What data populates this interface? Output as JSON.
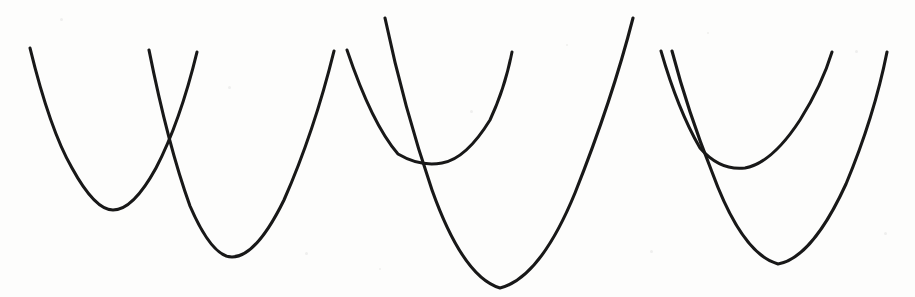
{
  "figure": {
    "width": 915,
    "height": 297,
    "background_color": "#fdfdfc",
    "stroke_color": "#181818",
    "stroke_width": 3.1,
    "caption": "",
    "panel_count": 3
  },
  "chart_data": {
    "type": "line",
    "subtitle": "",
    "xlabel": "",
    "ylabel": "",
    "xlim": [
      0,
      915
    ],
    "ylim": [
      297,
      0
    ],
    "grid": false,
    "legend": "none",
    "axes_visible": false,
    "tick_labels": [],
    "annotations": [],
    "coordinate_note": "Pixel coordinates; y increases downward as in image space.",
    "panels": [
      {
        "name": "panel-left",
        "relationship": "two distinct intersection points",
        "intersections": [
          [
            170,
            131
          ]
        ],
        "series": [
          {
            "name": "left-panel-curve-a",
            "role": "shallow-left-parabola",
            "vertex": [
              113,
              210
            ],
            "start": [
              30,
              48
            ],
            "end": [
              197,
              52
            ],
            "path": "M 30 48 Q 50 130 72 168 Q 95 210 113 210 Q 133 210 156 168 Q 180 122 197 52"
          },
          {
            "name": "left-panel-curve-b",
            "role": "deep-right-parabola",
            "vertex": [
              232,
              257
            ],
            "start": [
              149,
              50
            ],
            "end": [
              334,
              51
            ],
            "path": "M 149 50 Q 168 145 190 206 Q 212 257 232 257 Q 256 257 284 200 Q 314 132 334 51"
          }
        ]
      },
      {
        "name": "panel-middle",
        "relationship": "curves touch near the shallow vertex then diverge",
        "intersections": [
          [
            423,
            162
          ]
        ],
        "series": [
          {
            "name": "middle-panel-curve-a",
            "role": "shallow-parabola",
            "vertex": [
              442,
              163
            ],
            "start": [
              347,
              50
            ],
            "end": [
              512,
              52
            ],
            "path": "M 347 50 Q 372 124 398 154 Q 420 167 442 163 Q 466 159 490 120 Q 505 88 512 52"
          },
          {
            "name": "middle-panel-curve-b",
            "role": "deep-parabola",
            "vertex": [
              500,
              288
            ],
            "start": [
              385,
              18
            ],
            "end": [
              633,
              18
            ],
            "path": "M 385 18 Q 404 108 432 190 Q 463 277 500 288 Q 540 278 575 193 Q 612 100 633 18"
          }
        ]
      },
      {
        "name": "panel-right",
        "relationship": "curves tangent near the start then separate",
        "intersections": [
          [
            694,
            140
          ]
        ],
        "series": [
          {
            "name": "right-panel-curve-a",
            "role": "shallow-parabola",
            "vertex": [
              745,
              168
            ],
            "start": [
              661,
              51
            ],
            "end": [
              832,
              52
            ],
            "path": "M 661 51 Q 678 110 700 148 Q 720 171 745 168 Q 772 163 800 120 Q 822 85 832 52"
          },
          {
            "name": "right-panel-curve-b",
            "role": "deep-parabola",
            "vertex": [
              778,
              264
            ],
            "start": [
              672,
              51
            ],
            "end": [
              887,
              52
            ],
            "path": "M 672 51 Q 688 112 712 172 Q 742 254 778 264 Q 812 258 846 184 Q 874 117 887 52"
          }
        ]
      }
    ]
  },
  "speckles": [
    {
      "x": 60,
      "y": 18,
      "size": 3
    },
    {
      "x": 228,
      "y": 86,
      "size": 3
    },
    {
      "x": 305,
      "y": 252,
      "size": 3
    },
    {
      "x": 379,
      "y": 268,
      "size": 2
    },
    {
      "x": 470,
      "y": 110,
      "size": 3
    },
    {
      "x": 566,
      "y": 44,
      "size": 2
    },
    {
      "x": 650,
      "y": 250,
      "size": 3
    },
    {
      "x": 707,
      "y": 32,
      "size": 2
    },
    {
      "x": 855,
      "y": 50,
      "size": 3
    },
    {
      "x": 884,
      "y": 232,
      "size": 3
    }
  ]
}
